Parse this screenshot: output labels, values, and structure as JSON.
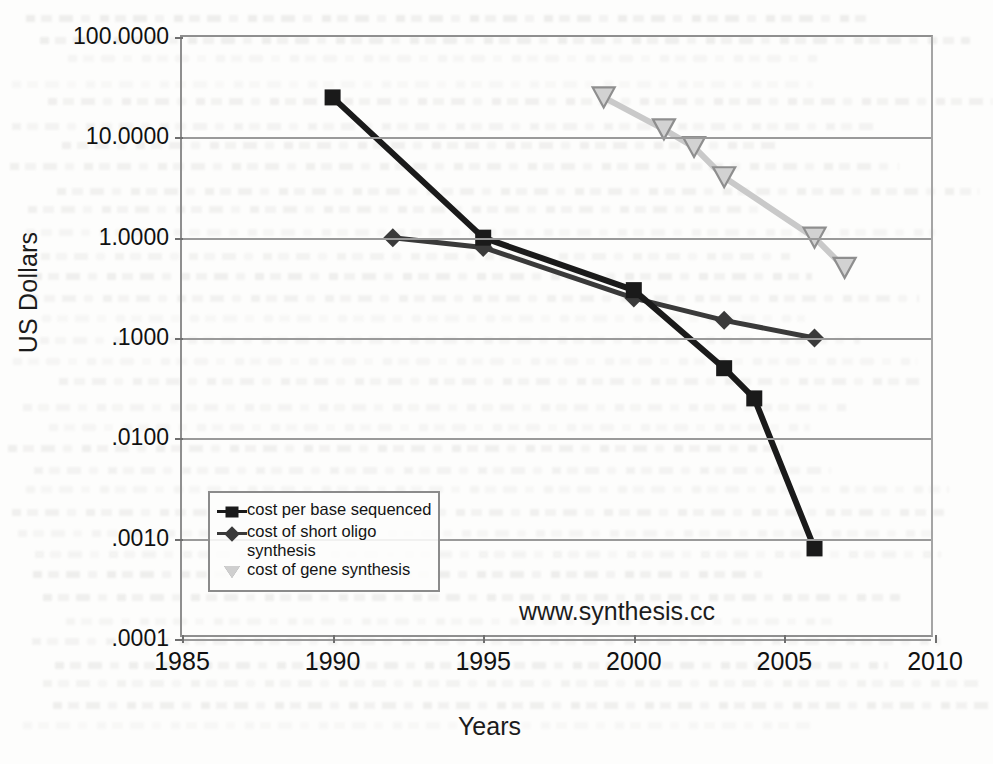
{
  "chart_data": {
    "type": "line",
    "title": "",
    "xlabel": "Years",
    "ylabel": "US Dollars",
    "yscale": "log",
    "ylim": [
      0.0001,
      100.0
    ],
    "xlim": [
      1985,
      2010
    ],
    "grid": true,
    "legend_position": "inside-bottom-left",
    "annotations": [
      "www.synthesis.cc"
    ],
    "ytick_labels": [
      "100.0000",
      "10.0000",
      "1.0000",
      ".1000",
      ".0100",
      ".0010",
      ".0001"
    ],
    "ytick_values": [
      100.0,
      10.0,
      1.0,
      0.1,
      0.01,
      0.001,
      0.0001
    ],
    "xtick_labels": [
      "1985",
      "1990",
      "1995",
      "2000",
      "2005",
      "2010"
    ],
    "xtick_values": [
      1985,
      1990,
      1995,
      2000,
      2005,
      2010
    ],
    "series": [
      {
        "name": "cost per base sequenced",
        "marker": "square",
        "color": "#1a1a1a",
        "x": [
          1990,
          1995,
          2000,
          2003,
          2004,
          2006
        ],
        "values": [
          25.0,
          1.0,
          0.3,
          0.05,
          0.025,
          0.0008
        ]
      },
      {
        "name": "cost of short oligo synthesis",
        "marker": "diamond",
        "color": "#3a3a3a",
        "x": [
          1992,
          1995,
          2000,
          2003,
          2006
        ],
        "values": [
          1.0,
          0.8,
          0.25,
          0.15,
          0.1
        ]
      },
      {
        "name": "cost of gene synthesis",
        "marker": "triangle-down",
        "color": "#c9c9c9",
        "x": [
          1999,
          2001,
          2002,
          2003,
          2006,
          2007
        ],
        "values": [
          25.0,
          12.0,
          8.0,
          4.0,
          1.0,
          0.5
        ]
      }
    ]
  },
  "axes": {
    "y_title": "US Dollars",
    "x_title": "Years"
  },
  "legend": {
    "entries": [
      {
        "label": "cost per base sequenced",
        "marker": "square-marker-icon"
      },
      {
        "label": "cost of short oligo synthesis",
        "marker": "diamond-marker-icon"
      },
      {
        "label": "cost of gene synthesis",
        "marker": "triangle-marker-icon"
      }
    ]
  },
  "watermark": {
    "text": "www.synthesis.cc"
  },
  "colors": {
    "series_sequencing": "#1a1a1a",
    "series_oligo": "#3a3a3a",
    "series_gene": "#c9c9c9",
    "grid": "#9a9a9a",
    "frame": "#8f8f8f",
    "text": "#111111"
  }
}
